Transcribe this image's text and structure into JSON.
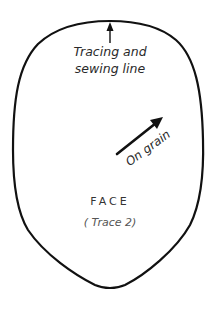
{
  "pattern": {
    "piece_name": "FACE",
    "trace_note": "( Trace 2)",
    "outline_label_line1": "Tracing and",
    "outline_label_line2": "sewing line",
    "grain_label": "On grain"
  },
  "icons": {
    "outline_arrow": "arrow-up-icon",
    "grain_arrow": "arrow-diagonal-up-right-icon"
  },
  "colors": {
    "outline": "#111111",
    "text": "#2a2a2a",
    "subtitle": "#555555",
    "background": "#ffffff"
  }
}
